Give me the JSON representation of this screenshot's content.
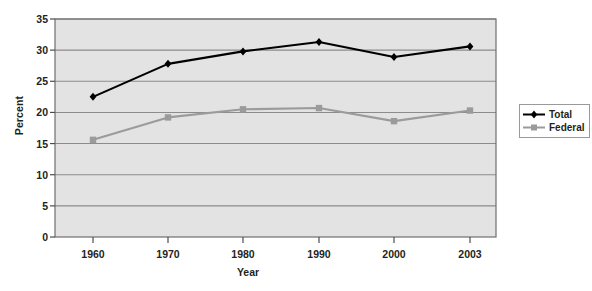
{
  "chart_data": {
    "type": "line",
    "title": "",
    "xlabel": "Year",
    "ylabel": "Percent",
    "categories": [
      "1960",
      "1970",
      "1980",
      "1990",
      "2000",
      "2003"
    ],
    "x": [
      1960,
      1970,
      1980,
      1990,
      2000,
      2003
    ],
    "ylim": [
      0,
      35
    ],
    "yticks": [
      0,
      5,
      10,
      15,
      20,
      25,
      30,
      35
    ],
    "ytick_labels": [
      "0",
      "5",
      "10",
      "15",
      "20",
      "25",
      "30",
      "35"
    ],
    "grid": "horizontal",
    "legend_position": "right",
    "series": [
      {
        "name": "Total",
        "color": "#000000",
        "marker": "diamond",
        "values": [
          22.5,
          27.8,
          29.8,
          31.3,
          28.9,
          30.6
        ]
      },
      {
        "name": "Federal",
        "color": "#9b9b9b",
        "marker": "square",
        "values": [
          15.6,
          19.2,
          20.5,
          20.7,
          18.6,
          20.3
        ]
      }
    ]
  },
  "legend": {
    "items": [
      {
        "label": "Total"
      },
      {
        "label": "Federal"
      }
    ]
  },
  "colors": {
    "plot_background": "#e3e3e3",
    "gridline": "#8c8c8c",
    "frame": "#6f6f6f",
    "text": "#231f20",
    "total": "#000000",
    "federal": "#9b9b9b"
  }
}
